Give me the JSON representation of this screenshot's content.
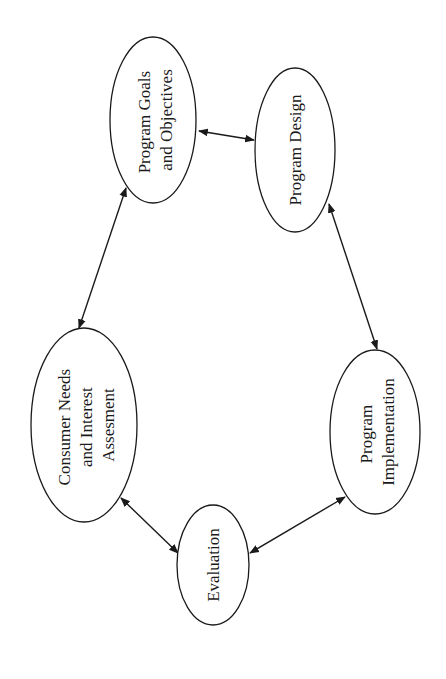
{
  "diagram": {
    "type": "cycle",
    "orientation": "rotated-90-ccw",
    "colors": {
      "stroke": "#1a1a1a",
      "fill": "#ffffff",
      "background": "#ffffff"
    },
    "nodes": [
      {
        "id": "goals",
        "lines": [
          "Program Goals",
          "and Objectives"
        ]
      },
      {
        "id": "design",
        "lines": [
          "Program Design"
        ]
      },
      {
        "id": "implementation",
        "lines": [
          "Program",
          "Implementation"
        ]
      },
      {
        "id": "evaluation",
        "lines": [
          "Evaluation"
        ]
      },
      {
        "id": "consumer",
        "lines": [
          "Consumer Needs",
          "and Interest",
          "Assesment"
        ]
      }
    ],
    "edges": [
      {
        "from": "goals",
        "to": "design",
        "direction": "both"
      },
      {
        "from": "design",
        "to": "implementation",
        "direction": "both"
      },
      {
        "from": "implementation",
        "to": "evaluation",
        "direction": "both"
      },
      {
        "from": "evaluation",
        "to": "consumer",
        "direction": "both"
      },
      {
        "from": "consumer",
        "to": "goals",
        "direction": "both"
      }
    ]
  }
}
